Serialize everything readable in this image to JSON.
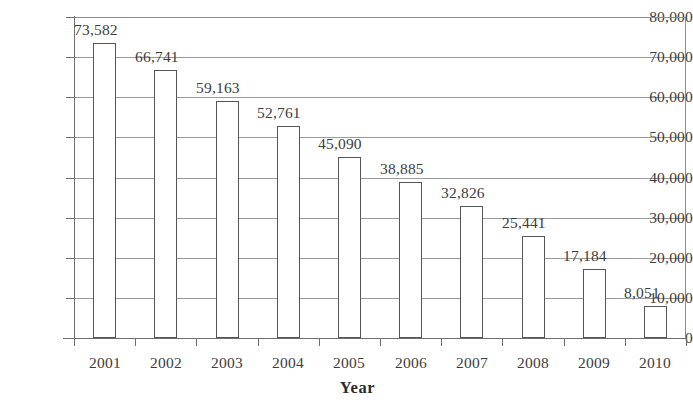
{
  "chart_data": {
    "type": "bar",
    "title": "",
    "xlabel": "Year",
    "ylabel": "",
    "categories": [
      "2001",
      "2002",
      "2003",
      "2004",
      "2005",
      "2006",
      "2007",
      "2008",
      "2009",
      "2010"
    ],
    "values": [
      73582,
      66741,
      59163,
      52761,
      45090,
      38885,
      32826,
      25441,
      17184,
      8051
    ],
    "data_labels": [
      "73,582",
      "66,741",
      "59,163",
      "52,761",
      "45,090",
      "38,885",
      "32,826",
      "25,441",
      "17,184",
      "8,051"
    ],
    "ylim": [
      0,
      80000
    ],
    "y_tick_step": 10000,
    "y_tick_labels": [
      "80,000",
      "70,000",
      "60,000",
      "50,000",
      "40,000",
      "30,000",
      "20,000",
      "10,000",
      "0"
    ],
    "y_tick_values": [
      80000,
      70000,
      60000,
      50000,
      40000,
      30000,
      20000,
      10000,
      0
    ],
    "grid": true,
    "grid_axis": "y",
    "legend": false,
    "bar_fill_color": "#ffffff",
    "bar_border_color": "#555555",
    "gridline_color": "#9a9a9a",
    "axis_color": "#6f6f6f",
    "text_color": "#3d3d3d",
    "background_color": "#ffffff"
  }
}
